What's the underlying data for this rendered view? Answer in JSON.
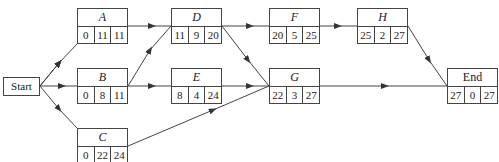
{
  "start": {
    "label": "Start"
  },
  "nodes": {
    "A": {
      "label": "A",
      "values": [
        "0",
        "11",
        "11"
      ]
    },
    "B": {
      "label": "B",
      "values": [
        "0",
        "8",
        "11"
      ]
    },
    "C": {
      "label": "C",
      "values": [
        "0",
        "22",
        "24"
      ]
    },
    "D": {
      "label": "D",
      "values": [
        "11",
        "9",
        "20"
      ]
    },
    "E": {
      "label": "E",
      "values": [
        "8",
        "4",
        "24"
      ]
    },
    "F": {
      "label": "F",
      "values": [
        "20",
        "5",
        "25"
      ]
    },
    "G": {
      "label": "G",
      "values": [
        "22",
        "3",
        "27"
      ]
    },
    "H": {
      "label": "H",
      "values": [
        "25",
        "2",
        "27"
      ]
    },
    "End": {
      "label": "End",
      "values": [
        "27",
        "0",
        "27"
      ]
    }
  },
  "edges": [
    [
      "Start",
      "A"
    ],
    [
      "Start",
      "B"
    ],
    [
      "Start",
      "C"
    ],
    [
      "A",
      "D"
    ],
    [
      "B",
      "D"
    ],
    [
      "B",
      "E"
    ],
    [
      "C",
      "G"
    ],
    [
      "D",
      "F"
    ],
    [
      "D",
      "G"
    ],
    [
      "E",
      "G"
    ],
    [
      "F",
      "H"
    ],
    [
      "H",
      "End"
    ],
    [
      "G",
      "End"
    ]
  ]
}
